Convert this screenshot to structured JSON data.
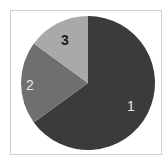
{
  "chart_data": {
    "type": "pie",
    "title": "",
    "categories": [
      "1",
      "2",
      "3"
    ],
    "values": [
      65,
      20,
      15
    ],
    "colors": [
      "#3b3b3b",
      "#6f6f6f",
      "#a9a9a9"
    ],
    "label_colors": [
      "#e6e6e6",
      "#e6e6e6",
      "#1a1a1a"
    ],
    "start_angle_deg": 0,
    "direction": "clockwise",
    "legend": "none",
    "labels_on_slices": true
  },
  "labels": {
    "slice1": "1",
    "slice2": "2",
    "slice3": "3"
  }
}
